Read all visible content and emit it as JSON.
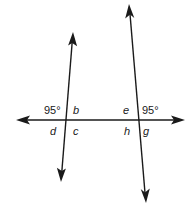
{
  "diagram": {
    "type": "parallel-lines-transversal",
    "stroke_color": "#1a1a1a",
    "background": "#ffffff",
    "lines": {
      "horizontal": {
        "x1": 16,
        "y1": 120,
        "x2": 185,
        "y2": 120,
        "arrows": "both"
      },
      "left_transversal": {
        "x1": 73,
        "y1": 32,
        "x2": 61,
        "y2": 182,
        "arrows": "both"
      },
      "right_transversal": {
        "x1": 129,
        "y1": 4,
        "x2": 146,
        "y2": 203,
        "arrows": "both"
      }
    },
    "intersections": {
      "left": {
        "x": 66,
        "y": 120
      },
      "right": {
        "x": 139,
        "y": 120
      }
    },
    "labels": {
      "left_upper_left": "95°",
      "left_upper_right": "b",
      "left_lower_left": "d",
      "left_lower_right": "c",
      "right_upper_left": "e",
      "right_upper_right": "95°",
      "right_lower_left": "h",
      "right_lower_right": "g"
    }
  }
}
